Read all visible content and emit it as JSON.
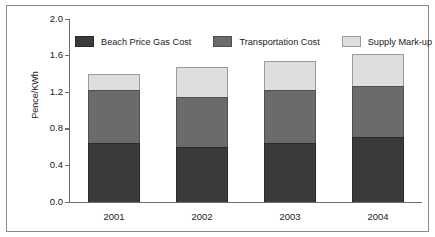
{
  "chart_data": {
    "type": "bar",
    "subtype": "stacked-bar",
    "title": "",
    "xlabel": "",
    "ylabel": "Pence/KWh",
    "categories": [
      "2001",
      "2002",
      "2003",
      "2004"
    ],
    "ylim": [
      0.0,
      2.0
    ],
    "ytick_labels": [
      "2.0",
      "1.6",
      "1.2",
      "0.8",
      "0.4",
      "0.0"
    ],
    "ytick_values": [
      2.0,
      1.6,
      1.2,
      0.8,
      0.4,
      0.0
    ],
    "grid": false,
    "legend_position": "top-inside",
    "series": [
      {
        "name": "Beach Price Gas Cost",
        "color": "#3b3b3b",
        "values": [
          0.65,
          0.6,
          0.65,
          0.71
        ]
      },
      {
        "name": "Transportation Cost",
        "color": "#6b6b6b",
        "values": [
          0.57,
          0.55,
          0.57,
          0.56
        ]
      },
      {
        "name": "Supply Mark-up",
        "color": "#dedede",
        "values": [
          0.18,
          0.33,
          0.32,
          0.35
        ]
      }
    ],
    "totals": [
      1.4,
      1.48,
      1.54,
      1.62
    ]
  },
  "legend": {
    "items": [
      {
        "label": "Beach Price Gas Cost",
        "swatch": "dark"
      },
      {
        "label": "Transportation Cost",
        "swatch": "medium"
      },
      {
        "label": "Supply Mark-up",
        "swatch": "light"
      }
    ]
  },
  "axes": {
    "y_title": "Pence/KWh"
  }
}
